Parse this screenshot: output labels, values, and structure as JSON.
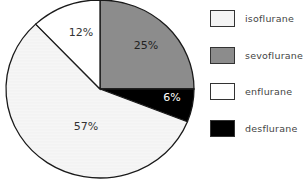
{
  "chart_data": {
    "type": "pie",
    "title": "",
    "categories": [
      "sevoflurane",
      "desflurane",
      "isoflurane",
      "enflurane"
    ],
    "values": [
      25,
      6,
      57,
      12
    ],
    "labels": [
      "25%",
      "6%",
      "57%",
      "12%"
    ],
    "colors": [
      "#8c8c8c",
      "#000000",
      "#f4f4f4",
      "#ffffff"
    ],
    "label_colors": [
      "#222222",
      "#ffffff",
      "#333333",
      "#333333"
    ],
    "start_angle_deg": 0,
    "direction": "clockwise",
    "legend_position": "right",
    "legend": [
      {
        "label": "isoflurane",
        "color": "#f4f4f4"
      },
      {
        "label": "sevoflurane",
        "color": "#8c8c8c"
      },
      {
        "label": "enflurane",
        "color": "#ffffff"
      },
      {
        "label": "desflurane",
        "color": "#000000"
      }
    ]
  }
}
